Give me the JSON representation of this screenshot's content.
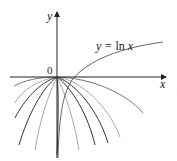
{
  "diagram": {
    "type": "function-graph",
    "axes": {
      "x_label": "x",
      "y_label": "y",
      "origin_label": "0"
    },
    "curve_label": {
      "prefix": "y = ",
      "fn": "ln",
      "var": " x"
    },
    "colors": {
      "axis": "#222222",
      "ln_curve": "#666666",
      "family_dark": "#333333",
      "family_mid": "#777777",
      "family_light": "#aaaaaa"
    },
    "curves": {
      "ln": "M58,158 C59,120 62,95 72,80 C88,60 120,48 163,42",
      "family": [
        {
          "d": "M57,77 C40,77 25,80 14,86",
          "tone": "family_mid"
        },
        {
          "d": "M57,77 C38,80 22,90 15,103",
          "tone": "family_light"
        },
        {
          "d": "M57,77 C40,82 24,100 15,118",
          "tone": "family_dark"
        },
        {
          "d": "M57,77 C42,88 28,115 19,145",
          "tone": "family_dark"
        },
        {
          "d": "M57,77 C48,95 40,120 35,150",
          "tone": "family_light"
        },
        {
          "d": "M57,77 C59,90 58,130 57,155",
          "tone": "family_dark"
        },
        {
          "d": "M57,77 C66,95 74,120 79,150",
          "tone": "family_light"
        },
        {
          "d": "M57,77 C72,88 88,115 95,145",
          "tone": "family_dark"
        },
        {
          "d": "M57,77 C76,84 98,110 108,143",
          "tone": "family_dark"
        },
        {
          "d": "M57,77 C80,80 108,105 120,137",
          "tone": "family_light"
        },
        {
          "d": "M57,77 C90,78 125,92 143,113",
          "tone": "family_mid"
        }
      ]
    }
  }
}
